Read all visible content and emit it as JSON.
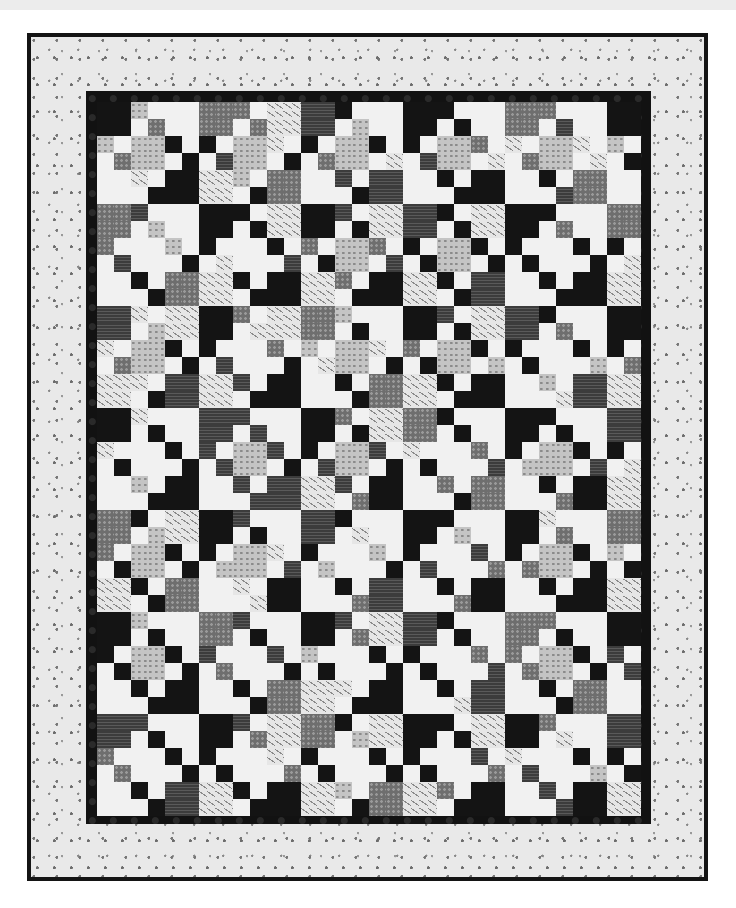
{
  "caption": {
    "text": ""
  },
  "image": {
    "subject": "black-and-white patchwork quilt",
    "grid": {
      "columns": 32,
      "rows": 42,
      "unit_px": 17
    },
    "palette": {
      "white": "#f1f1f1",
      "light_grey_print": "#c4c4c4",
      "mid_grey_print": "#6e6e6e",
      "dark_stripe": "#3c3c3c",
      "black": "#141414",
      "white_leaf_print": "#e6e6e6",
      "binding": "#141414",
      "outer_border": "#e9e9e9",
      "inner_border": "#121212"
    },
    "block_tones": [
      [
        4,
        2,
        3,
        4,
        2,
        4
      ],
      [
        2,
        4,
        4,
        3,
        4,
        2
      ],
      [
        3,
        4,
        2,
        4,
        3,
        4
      ],
      [
        4,
        3,
        4,
        2,
        4,
        3
      ],
      [
        2,
        4,
        3,
        4,
        4,
        2
      ],
      [
        4,
        2,
        4,
        3,
        2,
        4
      ],
      [
        3,
        4,
        2,
        4,
        4,
        3
      ]
    ]
  }
}
